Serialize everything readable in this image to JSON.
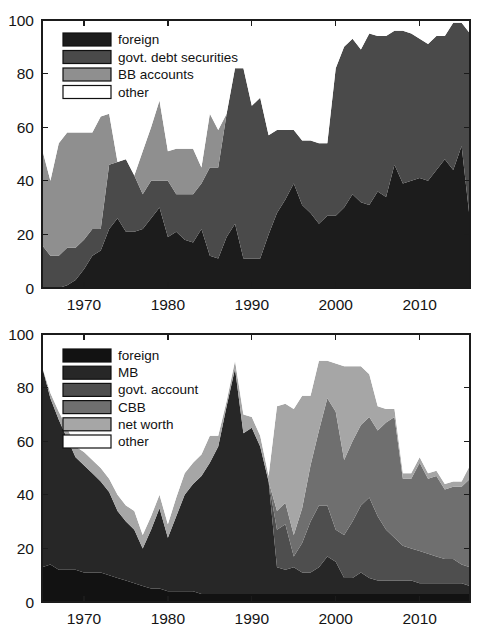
{
  "figure": {
    "width": 486,
    "height": 628,
    "background": "#ffffff"
  },
  "chart_data": [
    {
      "id": "top",
      "type": "area",
      "stacked": true,
      "title": "",
      "subtitle": "",
      "xlabel": "",
      "ylabel": "",
      "xlim": [
        1965,
        2016
      ],
      "ylim": [
        0,
        100
      ],
      "xticks": [
        1970,
        1980,
        1990,
        2000,
        2010
      ],
      "xtick_labels": [
        "1970",
        "1980",
        "1990",
        "2000",
        "2010"
      ],
      "yticks": [
        0,
        20,
        40,
        60,
        80,
        100
      ],
      "ytick_labels": [
        "0",
        "20",
        "40",
        "60",
        "80",
        "100"
      ],
      "grid": false,
      "legend_position": "top-left",
      "legend_entries": [
        "foreign",
        "govt. debt securities",
        "BB accounts",
        "other"
      ],
      "colors": [
        "#1c1c1c",
        "#4a4a4a",
        "#8f8f8f",
        "#ffffff"
      ],
      "x": [
        1965,
        1966,
        1967,
        1968,
        1969,
        1970,
        1971,
        1972,
        1973,
        1974,
        1975,
        1976,
        1977,
        1978,
        1979,
        1980,
        1981,
        1982,
        1983,
        1984,
        1985,
        1986,
        1987,
        1988,
        1989,
        1990,
        1991,
        1992,
        1993,
        1994,
        1995,
        1996,
        1997,
        1998,
        1999,
        2000,
        2001,
        2002,
        2003,
        2004,
        2005,
        2006,
        2007,
        2008,
        2009,
        2010,
        2011,
        2012,
        2013,
        2014,
        2015,
        2016
      ],
      "series": [
        {
          "name": "foreign",
          "color": "#1c1c1c",
          "values": [
            0,
            0,
            0,
            1,
            3,
            7,
            12,
            14,
            22,
            26,
            21,
            21,
            22,
            26,
            30,
            19,
            21,
            18,
            17,
            22,
            12,
            11,
            19,
            24,
            11,
            11,
            11,
            20,
            28,
            33,
            39,
            31,
            28,
            24,
            27,
            27,
            30,
            35,
            32,
            31,
            36,
            34,
            46,
            39,
            40,
            41,
            40,
            44,
            48,
            44,
            53,
            25
          ]
        },
        {
          "name": "govt. debt securities",
          "color": "#4a4a4a",
          "values": [
            16,
            12,
            12,
            14,
            12,
            11,
            10,
            8,
            24,
            21,
            27,
            21,
            13,
            14,
            10,
            21,
            14,
            17,
            18,
            17,
            33,
            34,
            46,
            58,
            71,
            57,
            60,
            37,
            31,
            26,
            20,
            24,
            27,
            30,
            27,
            55,
            60,
            58,
            57,
            64,
            58,
            60,
            50,
            57,
            55,
            52,
            51,
            50,
            46,
            55,
            46,
            70
          ]
        },
        {
          "name": "BB accounts",
          "color": "#8f8f8f",
          "values": [
            36,
            28,
            42,
            43,
            43,
            40,
            36,
            42,
            19,
            0,
            0,
            0,
            16,
            20,
            30,
            11,
            17,
            17,
            17,
            6,
            20,
            14,
            0,
            0,
            0,
            0,
            0,
            0,
            0,
            0,
            0,
            0,
            0,
            0,
            0,
            0,
            0,
            0,
            0,
            0,
            0,
            0,
            0,
            0,
            0,
            0,
            0,
            0,
            0,
            0,
            0,
            0
          ]
        },
        {
          "name": "other",
          "color": "#ffffff",
          "values": [
            48,
            60,
            46,
            42,
            42,
            42,
            42,
            36,
            35,
            53,
            52,
            58,
            49,
            40,
            30,
            49,
            48,
            48,
            48,
            55,
            35,
            41,
            35,
            18,
            18,
            32,
            29,
            43,
            41,
            41,
            41,
            45,
            45,
            46,
            46,
            18,
            10,
            7,
            11,
            5,
            6,
            6,
            4,
            4,
            5,
            7,
            9,
            6,
            6,
            1,
            1,
            5
          ]
        }
      ]
    },
    {
      "id": "bottom",
      "type": "area",
      "stacked": true,
      "title": "",
      "subtitle": "",
      "xlabel": "",
      "ylabel": "",
      "xlim": [
        1965,
        2016
      ],
      "ylim": [
        0,
        100
      ],
      "xticks": [
        1970,
        1980,
        1990,
        2000,
        2010
      ],
      "xtick_labels": [
        "1970",
        "1980",
        "1990",
        "2000",
        "2010"
      ],
      "yticks": [
        0,
        20,
        40,
        60,
        80,
        100
      ],
      "ytick_labels": [
        "0",
        "20",
        "40",
        "60",
        "80",
        "100"
      ],
      "grid": false,
      "legend_position": "top-left",
      "legend_entries": [
        "foreign",
        "MB",
        "govt. account",
        "CBB",
        "net worth",
        "other"
      ],
      "colors": [
        "#121212",
        "#272727",
        "#4e4e4e",
        "#6f6f6f",
        "#a6a6a6",
        "#ffffff"
      ],
      "x": [
        1965,
        1966,
        1967,
        1968,
        1969,
        1970,
        1971,
        1972,
        1973,
        1974,
        1975,
        1976,
        1977,
        1978,
        1979,
        1980,
        1981,
        1982,
        1983,
        1984,
        1985,
        1986,
        1987,
        1988,
        1989,
        1990,
        1991,
        1992,
        1993,
        1994,
        1995,
        1996,
        1997,
        1998,
        1999,
        2000,
        2001,
        2002,
        2003,
        2004,
        2005,
        2006,
        2007,
        2008,
        2009,
        2010,
        2011,
        2012,
        2013,
        2014,
        2015,
        2016
      ],
      "series": [
        {
          "name": "foreign",
          "color": "#121212",
          "values": [
            13,
            14,
            12,
            12,
            12,
            11,
            11,
            11,
            10,
            9,
            8,
            7,
            6,
            5,
            5,
            4,
            4,
            4,
            4,
            3,
            3,
            3,
            3,
            3,
            3,
            3,
            3,
            3,
            3,
            3,
            3,
            3,
            3,
            3,
            3,
            3,
            3,
            3,
            3,
            3,
            3,
            3,
            3,
            3,
            3,
            3,
            3,
            3,
            3,
            3,
            3,
            3
          ]
        },
        {
          "name": "MB",
          "color": "#272727",
          "values": [
            75,
            62,
            56,
            49,
            42,
            40,
            37,
            34,
            31,
            25,
            22,
            20,
            14,
            22,
            30,
            20,
            28,
            36,
            40,
            44,
            49,
            55,
            70,
            84,
            60,
            62,
            55,
            42,
            10,
            9,
            10,
            8,
            8,
            10,
            14,
            12,
            6,
            6,
            8,
            6,
            5,
            5,
            5,
            5,
            5,
            4,
            4,
            4,
            4,
            4,
            4,
            3
          ]
        },
        {
          "name": "govt. account",
          "color": "#4e4e4e",
          "values": [
            0,
            0,
            0,
            0,
            0,
            0,
            0,
            0,
            0,
            0,
            0,
            0,
            0,
            0,
            0,
            0,
            0,
            0,
            0,
            0,
            0,
            0,
            0,
            0,
            0,
            0,
            0,
            0,
            14,
            17,
            4,
            11,
            19,
            23,
            19,
            12,
            16,
            21,
            25,
            30,
            24,
            19,
            16,
            13,
            12,
            12,
            11,
            10,
            9,
            9,
            7,
            7
          ]
        },
        {
          "name": "CBB",
          "color": "#6f6f6f",
          "values": [
            0,
            0,
            0,
            0,
            0,
            0,
            0,
            0,
            0,
            0,
            0,
            0,
            0,
            0,
            0,
            0,
            0,
            0,
            0,
            0,
            0,
            0,
            0,
            0,
            0,
            0,
            0,
            0,
            7,
            8,
            8,
            13,
            21,
            28,
            40,
            44,
            28,
            30,
            30,
            30,
            32,
            40,
            45,
            25,
            26,
            33,
            28,
            30,
            26,
            27,
            29,
            33
          ]
        },
        {
          "name": "net worth",
          "color": "#a6a6a6",
          "values": [
            0,
            2,
            3,
            4,
            4,
            5,
            5,
            5,
            5,
            6,
            6,
            7,
            5,
            5,
            5,
            5,
            7,
            8,
            8,
            8,
            10,
            4,
            2,
            3,
            7,
            4,
            4,
            2,
            39,
            37,
            47,
            42,
            26,
            26,
            14,
            18,
            35,
            28,
            22,
            16,
            9,
            5,
            3,
            2,
            2,
            2,
            2,
            2,
            2,
            2,
            2,
            5
          ]
        },
        {
          "name": "other",
          "color": "#ffffff",
          "values": [
            12,
            22,
            29,
            35,
            42,
            44,
            47,
            50,
            54,
            60,
            64,
            66,
            75,
            68,
            60,
            71,
            61,
            52,
            48,
            45,
            38,
            38,
            25,
            10,
            30,
            31,
            38,
            53,
            27,
            26,
            28,
            23,
            23,
            10,
            10,
            11,
            12,
            12,
            12,
            15,
            27,
            28,
            28,
            52,
            52,
            46,
            52,
            51,
            56,
            55,
            55,
            49
          ]
        }
      ]
    }
  ]
}
